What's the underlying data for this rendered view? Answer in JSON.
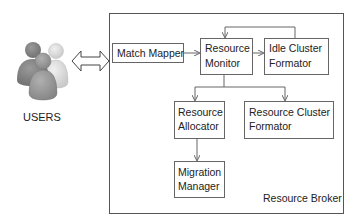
{
  "users": {
    "label": "USERS",
    "icon": "users-group-icon"
  },
  "connector": {
    "icon": "double-arrow-icon"
  },
  "broker": {
    "label": "Resource Broker",
    "components": {
      "match_mapper": {
        "lines": [
          "Match Mapper"
        ]
      },
      "resource_monitor": {
        "lines": [
          "Resource",
          "Monitor"
        ]
      },
      "idle_cluster_formator": {
        "lines": [
          "Idle Cluster",
          "Formator"
        ]
      },
      "resource_allocator": {
        "lines": [
          "Resource",
          "Allocator"
        ]
      },
      "resource_cluster_formator": {
        "lines": [
          "Resource Cluster",
          "Formator"
        ]
      },
      "migration_manager": {
        "lines": [
          "Migration",
          "Manager"
        ]
      }
    },
    "flows": [
      {
        "from": "Match Mapper",
        "to": "Resource Monitor"
      },
      {
        "from": "Resource Monitor",
        "to": "Idle Cluster Formator"
      },
      {
        "from": "Idle Cluster Formator",
        "to": "Resource Monitor"
      },
      {
        "from": "Resource Monitor",
        "to": "Resource Allocator"
      },
      {
        "from": "Resource Monitor",
        "to": "Resource Cluster Formator"
      },
      {
        "from": "Resource Allocator",
        "to": "Migration Manager"
      }
    ]
  },
  "colors": {
    "line": "#555555",
    "box_border": "#666666",
    "user_gray_dark": "#7d7d7d",
    "user_gray_mid": "#9a9a9a",
    "user_gray_light": "#d6d6d6"
  }
}
